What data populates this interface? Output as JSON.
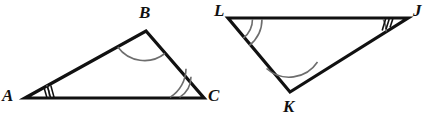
{
  "figure": {
    "stroke_color": "#111111",
    "arc_color": "#6d6d6d",
    "background": "#ffffff",
    "stroke_width": 3.2,
    "triangles": [
      {
        "name": "triangle-abc",
        "vertices": [
          {
            "label": "A",
            "x": 25,
            "y": 98,
            "label_x": 2,
            "label_y": 87,
            "mark": "arc-with-three-ticks",
            "arc_count": 1,
            "tick_count": 3
          },
          {
            "label": "B",
            "x": 146,
            "y": 31,
            "label_x": 139,
            "label_y": 4,
            "mark": "single-arc",
            "arc_count": 1,
            "tick_count": 0
          },
          {
            "label": "C",
            "x": 204,
            "y": 98,
            "label_x": 208,
            "label_y": 87,
            "mark": "double-arc",
            "arc_count": 2,
            "tick_count": 0
          }
        ]
      },
      {
        "name": "triangle-lkj",
        "vertices": [
          {
            "label": "L",
            "x": 228,
            "y": 18,
            "label_x": 214,
            "label_y": 2,
            "mark": "double-arc",
            "arc_count": 2,
            "tick_count": 0
          },
          {
            "label": "K",
            "x": 290,
            "y": 92,
            "label_x": 283,
            "label_y": 98,
            "mark": "single-arc",
            "arc_count": 1,
            "tick_count": 0
          },
          {
            "label": "J",
            "x": 408,
            "y": 18,
            "label_x": 413,
            "label_y": 2,
            "mark": "arc-with-three-ticks",
            "arc_count": 1,
            "tick_count": 3
          }
        ]
      }
    ]
  }
}
